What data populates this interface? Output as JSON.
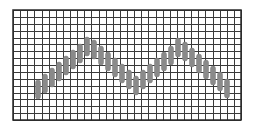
{
  "figure": {
    "width": 256,
    "height": 133
  },
  "grid": {
    "x0": 13,
    "y0": 10,
    "x1": 241,
    "y1": 120,
    "cols": 32,
    "rows": 16,
    "line_color": "#3a3a3a",
    "border_color": "#2a2a2a",
    "background": "#ffffff"
  },
  "pattern": {
    "fill_color": "#8a8a8a",
    "stroke_color": "#7a7a7a",
    "pill_width": 5,
    "pills": [
      {
        "x": 38,
        "y": 80,
        "h": 19
      },
      {
        "x": 45,
        "y": 74,
        "h": 19
      },
      {
        "x": 52,
        "y": 68,
        "h": 19
      },
      {
        "x": 59,
        "y": 62,
        "h": 19
      },
      {
        "x": 66,
        "y": 56,
        "h": 19
      },
      {
        "x": 73,
        "y": 50,
        "h": 19
      },
      {
        "x": 80,
        "y": 44,
        "h": 19
      },
      {
        "x": 87,
        "y": 37,
        "h": 19
      },
      {
        "x": 94,
        "y": 40,
        "h": 19
      },
      {
        "x": 101,
        "y": 46,
        "h": 19
      },
      {
        "x": 108,
        "y": 52,
        "h": 19
      },
      {
        "x": 115,
        "y": 58,
        "h": 19
      },
      {
        "x": 122,
        "y": 64,
        "h": 19
      },
      {
        "x": 129,
        "y": 70,
        "h": 19
      },
      {
        "x": 136,
        "y": 76,
        "h": 19
      },
      {
        "x": 143,
        "y": 70,
        "h": 19
      },
      {
        "x": 150,
        "y": 64,
        "h": 19
      },
      {
        "x": 157,
        "y": 58,
        "h": 19
      },
      {
        "x": 164,
        "y": 52,
        "h": 19
      },
      {
        "x": 171,
        "y": 46,
        "h": 19
      },
      {
        "x": 178,
        "y": 38,
        "h": 19
      },
      {
        "x": 185,
        "y": 42,
        "h": 19
      },
      {
        "x": 192,
        "y": 48,
        "h": 19
      },
      {
        "x": 199,
        "y": 54,
        "h": 19
      },
      {
        "x": 206,
        "y": 60,
        "h": 19
      },
      {
        "x": 213,
        "y": 66,
        "h": 19
      },
      {
        "x": 220,
        "y": 72,
        "h": 19
      },
      {
        "x": 227,
        "y": 79,
        "h": 19
      }
    ]
  }
}
